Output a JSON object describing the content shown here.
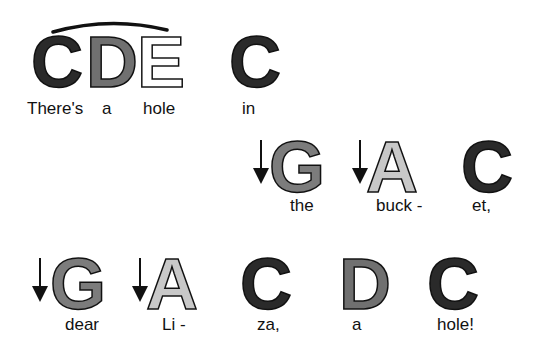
{
  "song": {
    "lines": [
      {
        "notes": [
          {
            "letter": "C",
            "lyric": "There's",
            "arrow": false
          },
          {
            "letter": "D",
            "lyric": "a",
            "arrow": false
          },
          {
            "letter": "E",
            "lyric": "hole",
            "arrow": false
          },
          {
            "letter": "C",
            "lyric": "in",
            "arrow": false
          }
        ],
        "slur_over": [
          "C",
          "D",
          "E"
        ]
      },
      {
        "notes": [
          {
            "letter": "G",
            "lyric": "the",
            "arrow": true
          },
          {
            "letter": "A",
            "lyric": "buck -",
            "arrow": true
          },
          {
            "letter": "C",
            "lyric": "et,",
            "arrow": false
          }
        ]
      },
      {
        "notes": [
          {
            "letter": "G",
            "lyric": "dear",
            "arrow": true
          },
          {
            "letter": "A",
            "lyric": "Li -",
            "arrow": true
          },
          {
            "letter": "C",
            "lyric": "za,",
            "arrow": false
          },
          {
            "letter": "D",
            "lyric": "a",
            "arrow": false
          },
          {
            "letter": "C",
            "lyric": "hole!",
            "arrow": false
          }
        ]
      }
    ],
    "colors": {
      "C": "#2a2a2a",
      "D": "#707070",
      "E": "#ffffff",
      "G": "#7c7c7c",
      "A": "#c8c8c8"
    },
    "icons": {
      "arrow": "down-arrow-icon",
      "slur": "slur-arc"
    }
  }
}
